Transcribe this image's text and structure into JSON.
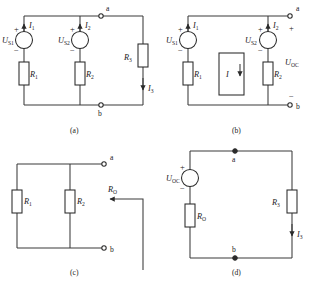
{
  "figure": {
    "kind": "circuit-diagram-sheet",
    "panels": [
      {
        "id": "a",
        "caption": "(a)",
        "sources": [
          {
            "name": "U",
            "sub": "S1",
            "plus": "+",
            "minus": "−",
            "current": {
              "name": "I",
              "sub": "1"
            }
          },
          {
            "name": "U",
            "sub": "S2",
            "plus": "+",
            "minus": "−",
            "current": {
              "name": "I",
              "sub": "2"
            }
          }
        ],
        "resistors": [
          {
            "name": "R",
            "sub": "1"
          },
          {
            "name": "R",
            "sub": "2"
          },
          {
            "name": "R",
            "sub": "3"
          }
        ],
        "currents": [
          {
            "name": "I",
            "sub": "3"
          }
        ],
        "terminals": [
          "a",
          "b"
        ]
      },
      {
        "id": "b",
        "caption": "(b)",
        "sources": [
          {
            "name": "U",
            "sub": "S1",
            "plus": "+",
            "minus": "−",
            "current": {
              "name": "I",
              "sub": "1"
            }
          },
          {
            "name": "U",
            "sub": "S2",
            "plus": "+",
            "minus": "−",
            "current": {
              "name": "I",
              "sub": "2"
            }
          }
        ],
        "resistors": [
          {
            "name": "R",
            "sub": "1"
          },
          {
            "name": "R",
            "sub": "2"
          }
        ],
        "open_branch_current": {
          "name": "I",
          "sub": ""
        },
        "output_voltage": {
          "name": "U",
          "sub": "OC",
          "plus": "+",
          "minus": "−"
        },
        "terminals": [
          "a",
          "b"
        ]
      },
      {
        "id": "c",
        "caption": "(c)",
        "resistors": [
          {
            "name": "R",
            "sub": "1"
          },
          {
            "name": "R",
            "sub": "2"
          }
        ],
        "equivalent_resistance": {
          "name": "R",
          "sub": "O"
        },
        "terminals": [
          "a",
          "b"
        ]
      },
      {
        "id": "d",
        "caption": "(d)",
        "sources": [
          {
            "name": "U",
            "sub": "OC",
            "plus": "+",
            "minus": "−"
          }
        ],
        "resistors": [
          {
            "name": "R",
            "sub": "O"
          },
          {
            "name": "R",
            "sub": "3"
          }
        ],
        "currents": [
          {
            "name": "I",
            "sub": "3"
          }
        ],
        "terminals": [
          "a",
          "b"
        ]
      }
    ]
  },
  "colors": {
    "wire": "#3a3a3a",
    "component": "#2a2a2a",
    "text": "#1a1a1a",
    "background": "#ffffff"
  }
}
